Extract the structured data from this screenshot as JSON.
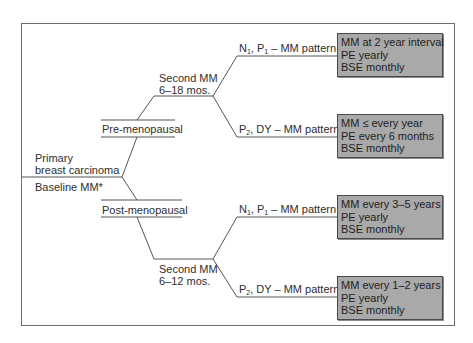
{
  "diagram": {
    "root": {
      "line1": "Primary",
      "line2": "breast carcinoma",
      "line3": "Baseline MM*"
    },
    "branches": [
      {
        "label": "Pre-menopausal",
        "second_mm": {
          "line1": "Second MM",
          "line2": "6–18 mos."
        },
        "outcomes": [
          {
            "pattern": {
              "a": "N",
              "a_sub": "1",
              "b": ", P",
              "b_sub": "1",
              "rest": " – MM pattern"
            },
            "recommendations": [
              "MM at 2 year interval",
              "PE yearly",
              "BSE monthly"
            ]
          },
          {
            "pattern": {
              "a": "P",
              "a_sub": "2",
              "rest": ", DY – MM pattern"
            },
            "recommendations": [
              "MM ≤ every year",
              "PE every 6 months",
              "BSE monthly"
            ]
          }
        ]
      },
      {
        "label": "Post-menopausal",
        "second_mm": {
          "line1": "Second MM",
          "line2": "6–12 mos."
        },
        "outcomes": [
          {
            "pattern": {
              "a": "N",
              "a_sub": "1",
              "b": ", P",
              "b_sub": "1",
              "rest": " – MM pattern"
            },
            "recommendations": [
              "MM every 3–5 years",
              "PE yearly",
              "BSE monthly"
            ]
          },
          {
            "pattern": {
              "a": "P",
              "a_sub": "2",
              "rest": ", DY – MM pattern"
            },
            "recommendations": [
              "MM every 1–2 years",
              "PE yearly",
              "BSE monthly"
            ]
          }
        ]
      }
    ],
    "colors": {
      "box_fill": "#a9a9a9",
      "line": "#555555",
      "frame": "#6e6e6e"
    }
  }
}
